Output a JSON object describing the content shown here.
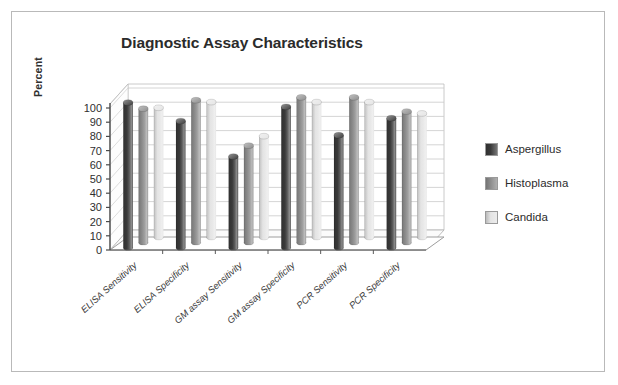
{
  "figure": {
    "background_color": "#ffffff",
    "border_color": "#b9b9b9"
  },
  "title": "Diagnostic Assay Characteristics",
  "y_axis": {
    "title": "Percent",
    "ticks": [
      "100",
      "90",
      "80",
      "70",
      "60",
      "50",
      "40",
      "30",
      "20",
      "10",
      "0"
    ]
  },
  "legend": {
    "entries": [
      {
        "label": "Aspergillus",
        "color": "#3a3a3a"
      },
      {
        "label": "Histoplasma",
        "color": "#8d8d8d"
      },
      {
        "label": "Candida",
        "color": "#e4e4e4"
      }
    ]
  },
  "chart_data": {
    "type": "bar",
    "title": "Diagnostic Assay Characteristics",
    "xlabel": "",
    "ylabel": "Percent",
    "ylim": [
      0,
      100
    ],
    "ytick_step": 10,
    "grid": true,
    "legend_position": "right",
    "style": "3d-cylinder-clustered",
    "categories": [
      "ELISA Sensitivity",
      "ELISA Specificity",
      "GM assay Sensitivity",
      "GM assay Specificity",
      "PCR Sensitivity",
      "PCR Specificity"
    ],
    "series": [
      {
        "name": "Aspergillus",
        "color": "#3a3a3a",
        "values": [
          102,
          89,
          64,
          99,
          79,
          91
        ]
      },
      {
        "name": "Histoplasma",
        "color": "#8d8d8d",
        "values": [
          94,
          100,
          68,
          102,
          102,
          92
        ]
      },
      {
        "name": "Candida",
        "color": "#e4e4e4",
        "values": [
          91,
          95,
          71,
          95,
          95,
          87
        ]
      }
    ]
  }
}
